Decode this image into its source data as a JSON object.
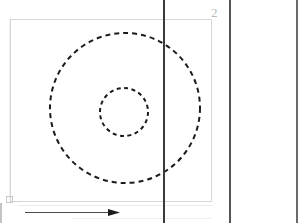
{
  "figure": {
    "type": "technical-line-drawing",
    "style": "patent-figure",
    "background_color": "#ffffff",
    "width": 301,
    "height": 223,
    "labels": [
      {
        "name": "reference-numeral-2",
        "text": "2",
        "color": "#b8b8b8",
        "x": 214,
        "y": 14
      }
    ],
    "boundary_rectangle": {
      "name": "boundary-rectangle",
      "x": 10,
      "y": 19,
      "width": 202,
      "height": 183,
      "stroke": "#d6d6d6",
      "stroke_width": 1,
      "fill": "none"
    },
    "corner_marker": {
      "name": "origin-corner-marker",
      "shape": "square",
      "x": 6,
      "y": 196,
      "size": 7,
      "stroke": "#c9c9c9",
      "stroke_width": 1,
      "fill": "none"
    },
    "circles": [
      {
        "name": "outer-dashed-circle",
        "cx": 125,
        "cy": 108,
        "r": 75,
        "stroke": "#1c1c1c",
        "stroke_width": 2,
        "dash_pattern": "5 4",
        "fill": "none"
      },
      {
        "name": "inner-dashed-circle",
        "cx": 124,
        "cy": 112,
        "r": 24,
        "stroke": "#1c1c1c",
        "stroke_width": 2,
        "dash_pattern": "4 3.5",
        "fill": "none"
      }
    ],
    "vertical_lines": [
      {
        "name": "vertical-line-left",
        "x": 164,
        "y1": 0,
        "y2": 223,
        "stroke": "#3a3a3a",
        "stroke_width": 2
      },
      {
        "name": "vertical-line-middle",
        "x": 230,
        "y1": 0,
        "y2": 223,
        "stroke": "#555555",
        "stroke_width": 2
      },
      {
        "name": "vertical-line-right",
        "x": 297,
        "y1": 0,
        "y2": 223,
        "stroke": "#6a6a6a",
        "stroke_width": 2
      }
    ],
    "faint_lines": [
      {
        "name": "faint-vertical-guide-left",
        "x": 10,
        "y1": 19,
        "y2": 202,
        "stroke": "#e2e2e2",
        "stroke_width": 1
      },
      {
        "name": "faint-baseline-lower",
        "x1": 18,
        "y1": 205,
        "x2": 212,
        "y2": 205,
        "stroke": "#ededed",
        "stroke_width": 1
      },
      {
        "name": "faint-baseline-bottom",
        "x1": 72,
        "y1": 218,
        "x2": 212,
        "y2": 218,
        "stroke": "#efefef",
        "stroke_width": 1
      }
    ],
    "arrow": {
      "name": "direction-arrow",
      "orientation": "horizontal-right",
      "x1": 25,
      "x2": 120,
      "y": 212,
      "stroke": "#4a4a4a",
      "stroke_width": 1,
      "head_length": 11,
      "head_half_width": 3.5,
      "head_fill": "#1c1c1c"
    },
    "left_edge_tick": {
      "name": "left-edge-tick",
      "x": 1,
      "y1": 203,
      "y2": 223,
      "stroke": "#c4c4c4",
      "stroke_width": 2
    }
  }
}
